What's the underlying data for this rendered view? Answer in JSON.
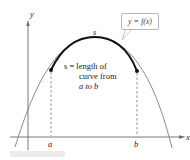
{
  "diagram": {
    "axes": {
      "x_label": "x",
      "y_label": "y"
    },
    "curve": {
      "name": "y = f(x)",
      "callout_label": "y = f(x)",
      "arc_label": "s"
    },
    "points": {
      "a_label": "a",
      "b_label": "b"
    },
    "annotation": {
      "line1": "s = length of",
      "line2": "curve from",
      "line3": "a to b"
    },
    "colors": {
      "curve": "#8a8a8a",
      "arc": "#111111",
      "axis": "#555555",
      "dashed": "#777777"
    }
  }
}
